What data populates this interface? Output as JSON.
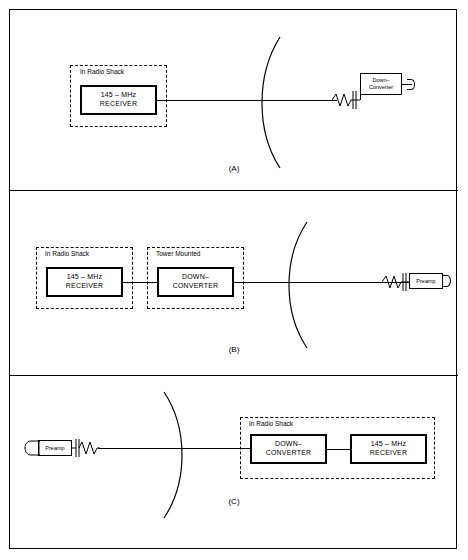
{
  "figure": {
    "title_caption_a": "(A)",
    "title_caption_b": "(B)",
    "title_caption_c": "(C)"
  },
  "panel_a": {
    "caption": "(A)",
    "dashed_label": "In Radio Shack",
    "receiver": {
      "line1": "145 – MHz",
      "line2": "RECEIVER"
    },
    "converter": {
      "line1": "Down–",
      "line2": "Converter"
    }
  },
  "panel_b": {
    "caption": "(B)",
    "dashed_label_left": "In Radio Shack",
    "dashed_label_right": "Tower Mounted",
    "receiver": {
      "line1": "145 – MHz",
      "line2": "RECEIVER"
    },
    "downconverter": {
      "line1": "DOWN–",
      "line2": "CONVERTER"
    },
    "preamp": {
      "line1": "Preamp"
    }
  },
  "panel_c": {
    "caption": "(C)",
    "dashed_label": "In Radio Shack",
    "receiver": {
      "line1": "145 – MHz",
      "line2": "RECEIVER"
    },
    "downconverter": {
      "line1": "DOWN–",
      "line2": "CONVERTER"
    },
    "preamp": {
      "line1": "Preamp"
    }
  },
  "colors": {
    "ink": "#000000",
    "paper": "#ffffff"
  }
}
